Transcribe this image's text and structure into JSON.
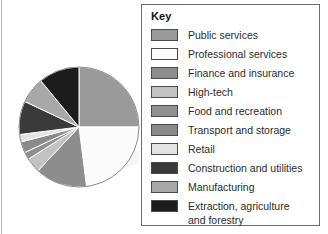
{
  "figure": {
    "name": "pie-chart-with-key"
  },
  "legend": {
    "title": "Key",
    "items": [
      {
        "label": "Public services",
        "color": "#9a9a9a"
      },
      {
        "label": "Professional services",
        "color": "#fbfbfb"
      },
      {
        "label": "Finance and insurance",
        "color": "#8d8d8d"
      },
      {
        "label": "High-tech",
        "color": "#c2c2c2"
      },
      {
        "label": "Food and recreation",
        "color": "#909090"
      },
      {
        "label": "Transport and storage",
        "color": "#8a8a8a"
      },
      {
        "label": "Retail",
        "color": "#e3e3e3"
      },
      {
        "label": "Construction and utilities",
        "color": "#3a3a3a"
      },
      {
        "label": "Manufacturing",
        "color": "#a8a8a8"
      },
      {
        "label": "Extraction, agriculture\nand forestry",
        "color": "#1c1c1c"
      }
    ]
  },
  "chart_data": {
    "type": "pie",
    "title": "",
    "legend_position": "right",
    "start_angle_deg": 0,
    "direction": "clockwise",
    "categories": [
      "Public services",
      "Professional services",
      "Finance and insurance",
      "High-tech",
      "Food and recreation",
      "Transport and storage",
      "Retail",
      "Construction and utilities",
      "Manufacturing",
      "Extraction, agriculture and forestry"
    ],
    "values": [
      25,
      23,
      14,
      4,
      2,
      3,
      2,
      9,
      7,
      11
    ],
    "unit": "percent",
    "colors": [
      "#9a9a9a",
      "#fbfbfb",
      "#8d8d8d",
      "#c2c2c2",
      "#909090",
      "#8a8a8a",
      "#e3e3e3",
      "#3a3a3a",
      "#a8a8a8",
      "#1c1c1c"
    ],
    "stroke": "#ffffff",
    "center": {
      "x": 62,
      "y": 62
    },
    "radius": 60
  }
}
